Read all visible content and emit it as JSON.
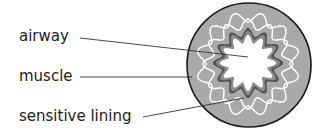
{
  "diagram": {
    "labels": [
      {
        "id": "airway",
        "text": "airway"
      },
      {
        "id": "muscle",
        "text": "muscle"
      },
      {
        "id": "lining",
        "text": "sensitive lining"
      }
    ],
    "colors": {
      "outer_fill": "#a9a9a9",
      "outer_stroke": "#1a1a1a",
      "muscle_fill": "#555555",
      "lining_fill": "#8c8c8c",
      "airway_fill": "#ffffff",
      "wavy_lines": "#ffffff",
      "leader_lines": "#333333"
    }
  }
}
